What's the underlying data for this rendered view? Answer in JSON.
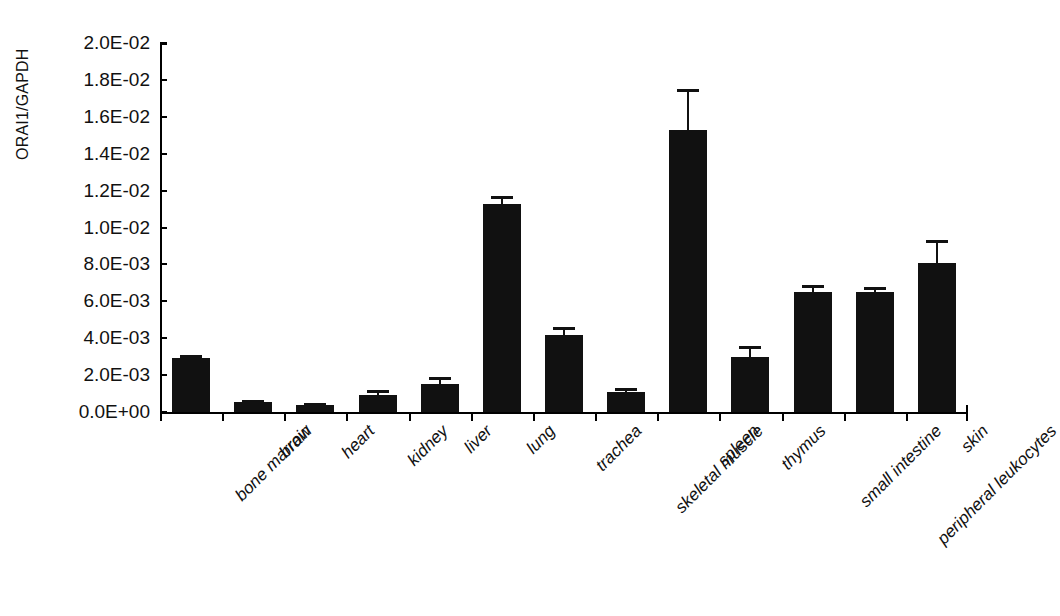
{
  "chart_data": {
    "type": "bar",
    "title": "",
    "subtitle": "",
    "xlabel": "",
    "ylabel": "ORAI1/GAPDH",
    "ylim": [
      0,
      0.02
    ],
    "ytick_values": [
      0,
      0.002,
      0.004,
      0.006,
      0.008,
      0.01,
      0.012,
      0.014,
      0.016,
      0.018,
      0.02
    ],
    "ytick_labels": [
      "0.0E+00",
      "2.0E-03",
      "4.0E-03",
      "6.0E-03",
      "8.0E-03",
      "1.0E-02",
      "1.2E-02",
      "1.4E-02",
      "1.6E-02",
      "1.8E-02",
      "2.0E-02"
    ],
    "grid": false,
    "legend": false,
    "bar_color": "#111111",
    "categories": [
      "bone marrow",
      "brain",
      "heart",
      "kidney",
      "liver",
      "lung",
      "trachea",
      "skeletal muscle",
      "spleen",
      "thymus",
      "small intestine",
      "peripheral leukocytes",
      "skin"
    ],
    "values": [
      0.0029,
      0.00055,
      0.0004,
      0.0009,
      0.0015,
      0.0113,
      0.0042,
      0.0011,
      0.0153,
      0.003,
      0.0065,
      0.0065,
      0.0081
    ],
    "errors": [
      0.0002,
      0.0001,
      8e-05,
      0.0003,
      0.0004,
      0.0004,
      0.0004,
      0.0002,
      0.0022,
      0.0006,
      0.0004,
      0.0003,
      0.0012
    ]
  }
}
